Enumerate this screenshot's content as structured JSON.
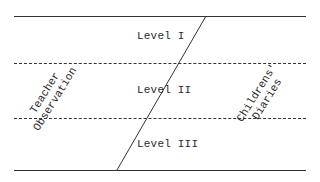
{
  "levels": [
    {
      "label": "Level I"
    },
    {
      "label": "Level II"
    },
    {
      "label": "Level III"
    }
  ],
  "left_axis": {
    "line1": "Teacher",
    "line2": "Observation"
  },
  "right_axis": {
    "line1": "Childrens'",
    "line2": "Diaries"
  },
  "colors": {
    "line": "#333333",
    "text": "#2a2a2a",
    "background": "#ffffff"
  }
}
